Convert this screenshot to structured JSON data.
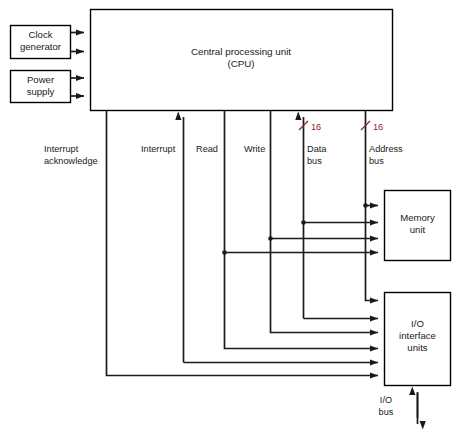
{
  "diagram": {
    "boxes": {
      "clock": {
        "line1": "Clock",
        "line2": "generator"
      },
      "power": {
        "line1": "Power",
        "line2": "supply"
      },
      "cpu": {
        "line1": "Central processing unit",
        "line2": "(CPU)"
      },
      "memory": {
        "line1": "Memory",
        "line2": "unit"
      },
      "io": {
        "line1": "I/O",
        "line2": "interface",
        "line3": "units"
      }
    },
    "bus_labels": {
      "interrupt_acknowledge": {
        "line1": "Interrupt",
        "line2": "acknowledge"
      },
      "interrupt": {
        "line1": "Interrupt"
      },
      "read": {
        "line1": "Read"
      },
      "write": {
        "line1": "Write"
      },
      "data_bus": {
        "line1": "Data",
        "line2": "bus"
      },
      "address_bus": {
        "line1": "Address",
        "line2": "bus"
      },
      "io_bus": {
        "line1": "I/O",
        "line2": "bus"
      }
    },
    "bus_widths": {
      "data_bus_width": "16",
      "address_bus_width": "16"
    },
    "colors": {
      "line": "#1a1a1a",
      "box_stroke": "#000000",
      "box_fill": "#ffffff",
      "width_label": "#8d2430",
      "background": "#ffffff"
    }
  }
}
